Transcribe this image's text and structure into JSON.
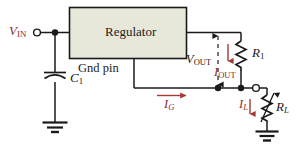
{
  "diagram": {
    "background_color": "#ffffff",
    "wire_color": "#1a1a1a",
    "block_fill": "#e7e8da",
    "block_border": "#1a1a1a",
    "label_black": "#1a1a1a",
    "label_red": "#8c2b2b",
    "arrow_red": "#a33a35"
  },
  "block": {
    "label": "Regulator"
  },
  "labels": {
    "v_in": {
      "base": "V",
      "sub": "IN",
      "color": "#8c2b2b"
    },
    "c1": {
      "base": "C",
      "sub": "1",
      "color": "#1a1a1a"
    },
    "gnd_pin": {
      "text": "Gnd pin",
      "color": "#1a1a1a"
    },
    "i_g": {
      "base": "I",
      "sub": "G",
      "color": "#8c2b2b"
    },
    "v_out": {
      "base": "V",
      "sub": "OUT",
      "color": "#1a1a1a"
    },
    "i_out": {
      "base": "I",
      "sub": "OUT",
      "color": "#8c2b2b"
    },
    "r1": {
      "base": "R",
      "sub": "1",
      "color": "#1a1a1a"
    },
    "i_l": {
      "base": "I",
      "sub": "L",
      "color": "#8c2b2b"
    },
    "rl": {
      "base": "R",
      "sub": "L",
      "color": "#1a1a1a"
    }
  },
  "components": [
    {
      "name": "regulator-block",
      "type": "block",
      "label": "Regulator"
    },
    {
      "name": "capacitor-c1",
      "type": "capacitor-polarized",
      "label": "C1"
    },
    {
      "name": "resistor-r1",
      "type": "resistor",
      "label": "R1"
    },
    {
      "name": "resistor-rl",
      "type": "resistor-variable",
      "label": "RL"
    },
    {
      "name": "ground-input",
      "type": "ground"
    },
    {
      "name": "ground-load",
      "type": "ground"
    },
    {
      "name": "terminal-vin",
      "type": "open-terminal"
    },
    {
      "name": "terminal-load",
      "type": "open-terminal"
    },
    {
      "name": "junction-vin",
      "type": "junction-dot"
    },
    {
      "name": "junction-vout",
      "type": "junction-dot"
    },
    {
      "name": "junction-load",
      "type": "junction-dot"
    }
  ],
  "currents": [
    {
      "name": "i-g",
      "label": "IG",
      "direction": "right"
    },
    {
      "name": "i-out",
      "label": "IOUT",
      "direction": "down"
    },
    {
      "name": "i-l",
      "label": "IL",
      "direction": "down"
    }
  ],
  "voltages": [
    {
      "name": "v-in",
      "label": "VIN"
    },
    {
      "name": "v-out",
      "label": "VOUT",
      "style": "double-headed-dashed"
    }
  ]
}
